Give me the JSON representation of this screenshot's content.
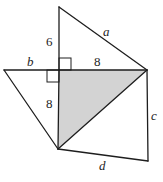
{
  "diagram": {
    "colors": {
      "line": "#1e1e1e",
      "shade": "#d3d3d3",
      "background": "#ffffff"
    },
    "points": {
      "top": [
        59,
        7
      ],
      "left": [
        4,
        70
      ],
      "center": [
        59,
        70
      ],
      "right": [
        147,
        70
      ],
      "bottom": [
        58,
        149
      ],
      "bottom_right": [
        148,
        161
      ]
    },
    "labels": {
      "a": "a",
      "b": "b",
      "c": "c",
      "d": "d",
      "six": "6",
      "eight_top": "8",
      "eight_left": "8"
    },
    "shaded_triangle": "center-right-bottom"
  }
}
